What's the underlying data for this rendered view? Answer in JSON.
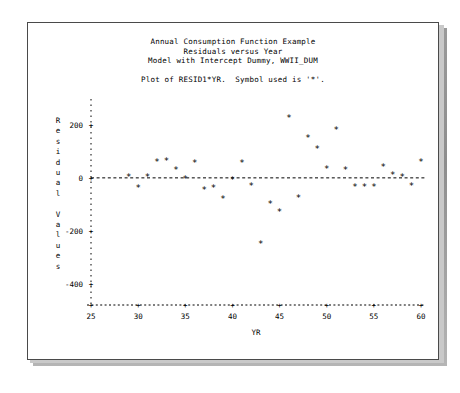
{
  "window": {
    "background_color": "#ffffff",
    "frame_color": "#4a4a4a",
    "shadow_color": "#8d8d8d"
  },
  "titles": {
    "line1": "Annual Consumption Function Example",
    "line2": "Residuals versus Year",
    "line3": "Model with Intercept Dummy, WWII_DUM",
    "symbol_line": "Plot of RESID1*YR.  Symbol used is '*'."
  },
  "chart_data": {
    "type": "scatter",
    "title": "Annual Consumption Function Example",
    "subtitle": "Residuals versus Year",
    "subtitle2": "Model with Intercept Dummy, WWII_DUM",
    "annotation": "Plot of RESID1*YR.  Symbol used is '*'.",
    "symbol": "*",
    "xlabel": "YR",
    "ylabel": "Residual Values",
    "ylabel_stack": [
      "R",
      "e",
      "s",
      "i",
      "d",
      "u",
      "a",
      "l",
      "",
      "V",
      "a",
      "l",
      "u",
      "e",
      "s"
    ],
    "xlim": [
      25,
      60
    ],
    "ylim": [
      -480,
      260
    ],
    "xticks": [
      25,
      30,
      35,
      40,
      45,
      50,
      55,
      60
    ],
    "xtick_labels": [
      "25",
      "30",
      "35",
      "40",
      "45",
      "50",
      "55",
      "60"
    ],
    "yticks": [
      200,
      0,
      -200,
      -400
    ],
    "ytick_labels": [
      "200",
      "0",
      "-200",
      "-400"
    ],
    "grid": false,
    "reference_line_y": 0,
    "reference_line_style": "dashed",
    "axis_style": "dashed-with-plus-ticks",
    "series": [
      {
        "name": "RESID1",
        "x": [
          29,
          30,
          31,
          32,
          33,
          34,
          35,
          36,
          37,
          38,
          39,
          40,
          41,
          42,
          43,
          44,
          45,
          46,
          47,
          48,
          49,
          50,
          51,
          52,
          53,
          54,
          55,
          56,
          57,
          58,
          59,
          60
        ],
        "y": [
          5,
          -40,
          2,
          60,
          62,
          30,
          -5,
          58,
          -45,
          -37,
          -80,
          -8,
          55,
          -30,
          -250,
          -100,
          -130,
          225,
          -75,
          150,
          110,
          35,
          180,
          30,
          -35,
          -35,
          -35,
          40,
          10,
          5,
          -30,
          60
        ]
      }
    ]
  }
}
